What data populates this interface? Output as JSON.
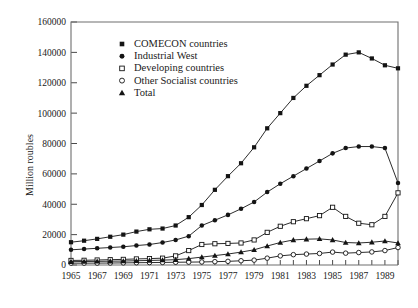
{
  "chart_data": {
    "type": "line",
    "title": "",
    "xlabel": "",
    "ylabel": "Million roubles",
    "xlim": [
      1965,
      1990
    ],
    "ylim": [
      0,
      160000
    ],
    "grid": false,
    "legend_position": "top-center-left",
    "x": [
      1965,
      1966,
      1967,
      1968,
      1969,
      1970,
      1971,
      1972,
      1973,
      1974,
      1975,
      1976,
      1977,
      1978,
      1979,
      1980,
      1981,
      1982,
      1983,
      1984,
      1985,
      1986,
      1987,
      1988,
      1989,
      1990
    ],
    "x_tick_labels": [
      "1965",
      "1967",
      "1969",
      "1971",
      "1973",
      "1975",
      "1977",
      "1979",
      "1981",
      "1983",
      "1985",
      "1987",
      "1989"
    ],
    "x_tick_values": [
      1965,
      1967,
      1969,
      1971,
      1973,
      1975,
      1977,
      1979,
      1981,
      1983,
      1985,
      1987,
      1989
    ],
    "y_tick_labels": [
      "0",
      "20000",
      "40000",
      "60000",
      "80000",
      "100000",
      "120000",
      "140000",
      "160000"
    ],
    "y_tick_values": [
      0,
      20000,
      40000,
      60000,
      80000,
      100000,
      120000,
      140000,
      160000
    ],
    "series": [
      {
        "name": "COMECON countries",
        "marker": "filled-square",
        "values": [
          15000,
          16000,
          17200,
          18600,
          20000,
          22000,
          23500,
          24000,
          26000,
          31500,
          39500,
          49500,
          58500,
          67000,
          77500,
          90000,
          100000,
          110000,
          118000,
          125000,
          132000,
          138500,
          140000,
          136000,
          131500,
          129500
        ]
      },
      {
        "name": "Industrial West",
        "marker": "filled-circle",
        "values": [
          10000,
          10500,
          11000,
          11500,
          12000,
          12800,
          13500,
          14800,
          16500,
          19000,
          26000,
          29500,
          33000,
          37000,
          41500,
          48000,
          53500,
          58500,
          63500,
          68500,
          73500,
          77000,
          78000,
          78000,
          77000,
          54000
        ]
      },
      {
        "name": "Developing countries",
        "marker": "open-square",
        "values": [
          3000,
          3100,
          3300,
          3500,
          3700,
          4000,
          4200,
          4500,
          6000,
          9500,
          13500,
          14000,
          14200,
          14500,
          16500,
          21500,
          25500,
          28500,
          30500,
          32500,
          38000,
          32000,
          27500,
          26500,
          32000,
          47500
        ]
      },
      {
        "name": "Other Socialist countries",
        "marker": "open-circle",
        "values": [
          1200,
          1200,
          1250,
          1300,
          1400,
          1500,
          1600,
          1700,
          1800,
          1900,
          2000,
          2200,
          2400,
          2800,
          3200,
          4500,
          6000,
          6800,
          7200,
          7600,
          8500,
          7800,
          8200,
          8600,
          9500,
          11500
        ]
      },
      {
        "name": "Total",
        "marker": "filled-triangle",
        "values": [
          2200,
          2300,
          2400,
          2500,
          2600,
          2800,
          3000,
          3200,
          3500,
          4200,
          5200,
          6200,
          7200,
          8500,
          10000,
          12500,
          14800,
          16500,
          17000,
          17200,
          16500,
          14800,
          14500,
          15000,
          15800,
          14500
        ]
      }
    ]
  },
  "legend": {
    "entries": [
      {
        "label": "COMECON countries",
        "marker": "filled-square"
      },
      {
        "label": "Industrial West",
        "marker": "filled-circle"
      },
      {
        "label": "Developing countries",
        "marker": "open-square"
      },
      {
        "label": "Other Socialist countries",
        "marker": "open-circle"
      },
      {
        "label": "Total",
        "marker": "filled-triangle"
      }
    ]
  },
  "colors": {
    "ink": "#141414",
    "axis": "#6e6e6e",
    "background": "#ffffff"
  }
}
